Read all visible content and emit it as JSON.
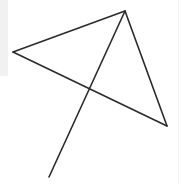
{
  "canvas": {
    "width": 183,
    "height": 184,
    "background_color": "#ffffff",
    "title": "Geometric line figure"
  },
  "background_marks": {
    "left_band": {
      "name": "left-gray-band",
      "x": 0,
      "y": 0,
      "width": 8,
      "height": 76,
      "color": "#f1f1f1"
    },
    "right_rule": {
      "name": "right-edge-rule",
      "x1": 178.5,
      "y1": 0,
      "x2": 178.5,
      "y2": 184,
      "color": "#f4f4f4",
      "width": 1
    }
  },
  "stroke": {
    "color": "#2b2b2b",
    "width": 1.6
  },
  "points": {
    "apex": {
      "label": "apex",
      "x": 125,
      "y": 11
    },
    "left": {
      "label": "left",
      "x": 13,
      "y": 52
    },
    "right": {
      "label": "right",
      "x": 167,
      "y": 126
    },
    "tail": {
      "label": "tail",
      "x": 49,
      "y": 177
    },
    "crossing": {
      "label": "crossing",
      "x": 85,
      "y": 90
    }
  },
  "segments": [
    {
      "name": "segment-apex-to-left",
      "from": "apex",
      "to": "left",
      "x1": 125,
      "y1": 11,
      "x2": 13,
      "y2": 52
    },
    {
      "name": "segment-left-to-right",
      "from": "left",
      "to": "right",
      "x1": 13,
      "y1": 52,
      "x2": 167,
      "y2": 126
    },
    {
      "name": "segment-apex-to-right",
      "from": "apex",
      "to": "right",
      "x1": 125,
      "y1": 11,
      "x2": 167,
      "y2": 126
    },
    {
      "name": "segment-apex-to-tail",
      "from": "apex",
      "to": "tail",
      "x1": 125,
      "y1": 11,
      "x2": 49,
      "y2": 177
    }
  ]
}
